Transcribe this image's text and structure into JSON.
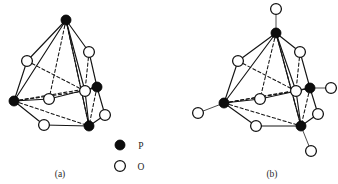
{
  "figure": {
    "background_color": "#ffffff",
    "line_color": "#141414"
  },
  "legend": {
    "name": "atom-legend",
    "entries": [
      {
        "symbol": "P",
        "marker": "filled-circle",
        "color": "#0d0d0d",
        "label": "P"
      },
      {
        "symbol": "O",
        "marker": "open-circle",
        "color": "#ffffff",
        "label": "O"
      }
    ]
  },
  "panels": [
    {
      "id": "a",
      "caption": "(a)",
      "formula": "P4O6",
      "phosphorus_count": 4,
      "oxygen_count": 6,
      "terminal_oxygen_count": 0,
      "bridging_oxygen_count": 6,
      "atoms": {
        "P": [
          {
            "name": "p-top",
            "x": 66,
            "y": 20
          },
          {
            "name": "p-left",
            "x": 14,
            "y": 101
          },
          {
            "name": "p-right",
            "x": 97,
            "y": 87
          },
          {
            "name": "p-bottom",
            "x": 89,
            "y": 126
          }
        ],
        "O_bridging": [
          {
            "name": "o-upper-left",
            "x": 27,
            "y": 61
          },
          {
            "name": "o-upper-right",
            "x": 89,
            "y": 52
          },
          {
            "name": "o-inner-left",
            "x": 49,
            "y": 99
          },
          {
            "name": "o-inner-mid",
            "x": 85,
            "y": 91
          },
          {
            "name": "o-lower-left",
            "x": 44,
            "y": 125
          },
          {
            "name": "o-lower-right",
            "x": 105,
            "y": 115
          }
        ]
      }
    },
    {
      "id": "b",
      "caption": "(b)",
      "formula": "P4O10",
      "phosphorus_count": 4,
      "oxygen_count": 10,
      "terminal_oxygen_count": 4,
      "bridging_oxygen_count": 6,
      "atoms": {
        "P": [
          {
            "name": "p-top",
            "x": 276,
            "y": 33
          },
          {
            "name": "p-left",
            "x": 224,
            "y": 103
          },
          {
            "name": "p-right",
            "x": 310,
            "y": 88
          },
          {
            "name": "p-bottom",
            "x": 301,
            "y": 126
          }
        ],
        "O_bridging": [
          {
            "name": "o-upper-left",
            "x": 238,
            "y": 61
          },
          {
            "name": "o-upper-right",
            "x": 300,
            "y": 52
          },
          {
            "name": "o-inner-left",
            "x": 260,
            "y": 99
          },
          {
            "name": "o-inner-mid",
            "x": 296,
            "y": 91
          },
          {
            "name": "o-lower-left",
            "x": 256,
            "y": 126
          },
          {
            "name": "o-lower-right",
            "x": 318,
            "y": 114
          }
        ],
        "O_terminal": [
          {
            "name": "o-term-top",
            "x": 276,
            "y": 9
          },
          {
            "name": "o-term-left",
            "x": 198,
            "y": 113
          },
          {
            "name": "o-term-right",
            "x": 331,
            "y": 88
          },
          {
            "name": "o-term-bottom",
            "x": 311,
            "y": 151
          }
        ]
      }
    }
  ],
  "markers": {
    "p_radius": 5.0,
    "o_radius": 5.4,
    "legend_p": {
      "x": 120,
      "y": 145
    },
    "legend_o": {
      "x": 120,
      "y": 166
    },
    "legend_label_p_x": 141,
    "legend_label_o_x": 141,
    "caption_a": {
      "x": 60,
      "y": 176
    },
    "caption_b": {
      "x": 272,
      "y": 176
    }
  }
}
